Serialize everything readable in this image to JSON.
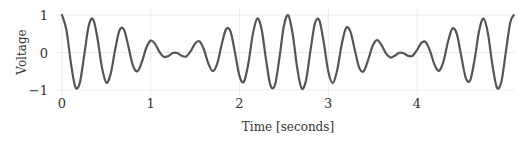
{
  "chart_data": {
    "type": "line",
    "title": "",
    "xlabel": "Time [seconds]",
    "ylabel": "Voltage",
    "xlim": [
      0,
      5.09
    ],
    "ylim": [
      -1,
      1
    ],
    "grid": true,
    "legend": null,
    "x_ticks": [
      0,
      1,
      2,
      3,
      4
    ],
    "x_tick_labels": [
      "0",
      "1",
      "2",
      "3",
      "4"
    ],
    "y_ticks": [
      1,
      0,
      -1
    ],
    "y_tick_labels": [
      "1",
      "0",
      "−1"
    ],
    "line_color": "#555555",
    "grid_color": "#ececec",
    "series": [
      {
        "name": "Voltage",
        "x": [
          0,
          0.05,
          0.1,
          0.15,
          0.2,
          0.25,
          0.3,
          0.35,
          0.4,
          0.45,
          0.5,
          0.55,
          0.6,
          0.65,
          0.7,
          0.75,
          0.8,
          0.85,
          0.9,
          0.95,
          1.0,
          1.05,
          1.1,
          1.15,
          1.2,
          1.25,
          1.3,
          1.35,
          1.4,
          1.45,
          1.5,
          1.55,
          1.6,
          1.65,
          1.7,
          1.75,
          1.8,
          1.85,
          1.9,
          1.95,
          2.0,
          2.05,
          2.1,
          2.15,
          2.2,
          2.25,
          2.3,
          2.35,
          2.4,
          2.45,
          2.5,
          2.55,
          2.6,
          2.65,
          2.7,
          2.75,
          2.8,
          2.85,
          2.9,
          2.95,
          3.0,
          3.05,
          3.1,
          3.15,
          3.2,
          3.25,
          3.3,
          3.35,
          3.4,
          3.45,
          3.5,
          3.55,
          3.6,
          3.65,
          3.7,
          3.75,
          3.8,
          3.85,
          3.9,
          3.95,
          4.0,
          4.05,
          4.1,
          4.15,
          4.2,
          4.25,
          4.3,
          4.35,
          4.4,
          4.45,
          4.5,
          4.55,
          4.6,
          4.65,
          4.7,
          4.75,
          4.8,
          4.85,
          4.9,
          4.95,
          5.0,
          5.05,
          5.09
        ],
        "y": [
          1.0,
          0.599,
          -0.277,
          -0.919,
          -0.818,
          -0.076,
          0.7,
          0.89,
          0.375,
          -0.397,
          -0.806,
          -0.555,
          0.092,
          0.605,
          0.598,
          0.14,
          -0.352,
          -0.5,
          -0.252,
          0.126,
          0.317,
          0.224,
          0.007,
          -0.12,
          -0.09,
          -0.012,
          -0.015,
          -0.091,
          -0.105,
          0.036,
          0.243,
          0.298,
          0.074,
          -0.299,
          -0.498,
          -0.288,
          0.221,
          0.627,
          0.551,
          -0.011,
          -0.629,
          -0.78,
          -0.288,
          0.483,
          0.907,
          0.606,
          -0.208,
          -0.884,
          -0.861,
          -0.14,
          0.706,
          0.991,
          0.48,
          -0.409,
          -0.959,
          -0.738,
          0.059,
          0.778,
          0.854,
          0.259,
          -0.501,
          -0.818,
          -0.48,
          0.195,
          0.65,
          0.557,
          0.058,
          -0.411,
          -0.495,
          -0.198,
          0.177,
          0.33,
          0.2,
          -0.023,
          -0.133,
          -0.088,
          -0.008,
          -0.018,
          -0.09,
          -0.087,
          0.065,
          0.257,
          0.273,
          0.019,
          -0.341,
          -0.485,
          -0.223,
          0.295,
          0.642,
          0.482,
          -0.114,
          -0.684,
          -0.737,
          -0.176,
          0.581,
          0.905,
          0.501,
          -0.334,
          -0.931,
          -0.788,
          -0.002,
          0.796,
          0.995
        ]
      }
    ]
  }
}
